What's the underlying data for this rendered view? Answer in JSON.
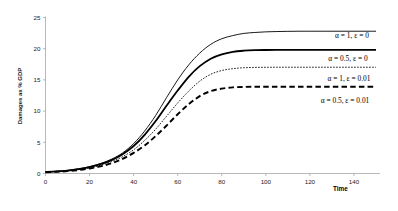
{
  "chart_data": {
    "type": "line",
    "title": "",
    "xlabel": "Time",
    "ylabel": "Damages as % GDP",
    "xlim": [
      0,
      150
    ],
    "ylim": [
      0,
      25
    ],
    "xticks": [
      0,
      20,
      40,
      60,
      80,
      100,
      120,
      140
    ],
    "yticks": [
      0,
      5,
      10,
      15,
      20,
      25
    ],
    "xtick_labels": [
      "0",
      "20",
      "40",
      "60",
      "80",
      "100",
      "120",
      "140"
    ],
    "ytick_labels": [
      "0",
      "5",
      "10",
      "15",
      "20",
      "25"
    ],
    "grid": false,
    "legend_position": "inline-right",
    "x": [
      0,
      5,
      10,
      15,
      20,
      25,
      30,
      35,
      40,
      45,
      50,
      55,
      60,
      65,
      70,
      75,
      80,
      85,
      90,
      95,
      100,
      105,
      110,
      115,
      120,
      125,
      130,
      135,
      140,
      145,
      150
    ],
    "series": [
      {
        "name": "alpha1-eps0",
        "label": "α = 1, ε = 0",
        "style": "solid-thin",
        "stroke_width": 0.9,
        "dash": "none",
        "color": "#000000",
        "plateau": 22.8,
        "label_x": 352,
        "label_y": 38,
        "values": [
          0.25,
          0.35,
          0.5,
          0.75,
          1.1,
          1.6,
          2.3,
          3.3,
          4.8,
          6.8,
          9.3,
          12.2,
          15.0,
          17.4,
          19.3,
          20.7,
          21.6,
          22.1,
          22.45,
          22.6,
          22.7,
          22.75,
          22.78,
          22.8,
          22.8,
          22.8,
          22.8,
          22.8,
          22.8,
          22.8,
          22.8
        ]
      },
      {
        "name": "alpha05-eps0",
        "label": "α = 0.5, ε = 0",
        "style": "solid-thick",
        "stroke_width": 1.8,
        "dash": "none",
        "color": "#000000",
        "plateau": 19.8,
        "label_x": 348,
        "label_y": 61,
        "values": [
          0.25,
          0.33,
          0.47,
          0.7,
          1.02,
          1.5,
          2.15,
          3.1,
          4.4,
          6.2,
          8.4,
          10.9,
          13.3,
          15.5,
          17.2,
          18.4,
          19.1,
          19.5,
          19.68,
          19.76,
          19.79,
          19.8,
          19.8,
          19.8,
          19.8,
          19.8,
          19.8,
          19.8,
          19.8,
          19.8,
          19.8
        ]
      },
      {
        "name": "alpha1-eps001",
        "label": "α = 1, ε = 0.01",
        "style": "dotted-thin",
        "stroke_width": 0.9,
        "dash": "1.6 1.4",
        "color": "#000000",
        "plateau": 17.0,
        "label_x": 349,
        "label_y": 81,
        "values": [
          0.22,
          0.3,
          0.42,
          0.62,
          0.9,
          1.32,
          1.9,
          2.7,
          3.8,
          5.3,
          7.1,
          9.2,
          11.3,
          13.2,
          14.8,
          15.9,
          16.5,
          16.8,
          16.95,
          17.0,
          17.02,
          17.03,
          17.03,
          17.03,
          17.03,
          17.03,
          17.03,
          17.03,
          17.03,
          17.03,
          17.03
        ]
      },
      {
        "name": "alpha05-eps001",
        "label": "α = 0.5, ε = 0.01",
        "style": "dashed-thick",
        "stroke_width": 1.9,
        "dash": "5.5 3.2",
        "color": "#000000",
        "plateau": 13.9,
        "label_x": 345,
        "label_y": 103,
        "values": [
          0.2,
          0.27,
          0.38,
          0.55,
          0.8,
          1.15,
          1.65,
          2.35,
          3.3,
          4.5,
          6.0,
          7.7,
          9.5,
          11.1,
          12.4,
          13.2,
          13.6,
          13.8,
          13.87,
          13.9,
          13.9,
          13.9,
          13.9,
          13.9,
          13.9,
          13.9,
          13.9,
          13.9,
          13.9,
          13.9,
          13.9
        ]
      }
    ]
  }
}
